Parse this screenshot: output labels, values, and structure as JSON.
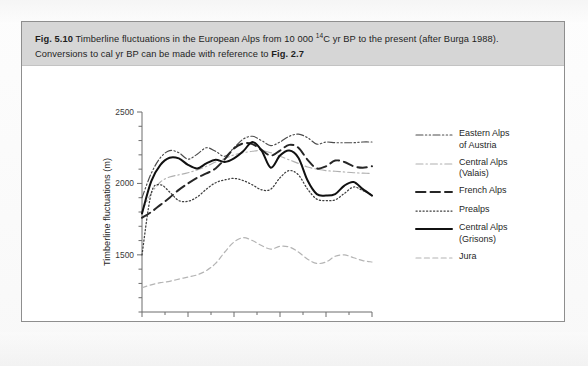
{
  "figure": {
    "caption_number": "Fig. 5.10",
    "caption_line1_a": "  Timberline fluctuations in the European Alps from 10 000 ",
    "caption_sup": "14",
    "caption_line1_b": "C yr BP to the present (after Burga 1988).",
    "caption_line2_a": "Conversions to cal yr BP can be made with reference to ",
    "caption_line2_ref": "Fig. 2.7"
  },
  "chart_data": {
    "type": "line",
    "title": "Timberline fluctuations in the European Alps",
    "xlabel": "Age (10³ years)",
    "ylabel": "Timberline fluctuations (m)",
    "xlim": [
      10,
      0
    ],
    "ylim": [
      1100,
      2500
    ],
    "x_ticks": [
      10,
      8,
      6,
      4,
      2,
      0
    ],
    "x_tick_labels": [
      "10",
      "8",
      "6",
      "4",
      "2",
      "0"
    ],
    "y_ticks": [
      1100,
      1200,
      1300,
      1400,
      1500,
      1600,
      1700,
      1800,
      1900,
      2000,
      2100,
      2200,
      2300,
      2400,
      2500
    ],
    "y_tick_labels_shown": [
      "2500",
      "2000",
      "1500"
    ],
    "y_labeled_ticks": [
      2500,
      2000,
      1500
    ],
    "grid": false,
    "legend_position": "right",
    "x_axis_direction": "reversed",
    "series": [
      {
        "name": "Eastern Alps of Austria",
        "style": "dash-dot-dot",
        "color": "#4c4c4c",
        "x": [
          10.0,
          9.6,
          9.2,
          8.8,
          8.4,
          8.0,
          7.6,
          7.2,
          6.8,
          6.4,
          6.0,
          5.6,
          5.2,
          4.8,
          4.4,
          4.0,
          3.6,
          3.2,
          2.8,
          2.4,
          2.0,
          1.6,
          1.2,
          0.8,
          0.4,
          0.0
        ],
        "y": [
          1900,
          2070,
          2180,
          2230,
          2215,
          2170,
          2205,
          2250,
          2225,
          2190,
          2250,
          2310,
          2330,
          2300,
          2265,
          2290,
          2330,
          2345,
          2320,
          2275,
          2290,
          2285,
          2285,
          2285,
          2290,
          2290
        ]
      },
      {
        "name": "Central Alps (Valais)",
        "style": "dash-dot",
        "color": "#b0b0b0",
        "x": [
          10.0,
          9.6,
          9.2,
          8.8,
          8.4,
          8.0,
          7.6,
          7.2,
          6.8,
          6.4,
          6.0,
          5.6,
          5.2,
          4.8,
          4.4,
          4.0,
          3.6,
          3.2,
          2.8,
          2.4,
          2.0,
          1.6,
          1.2,
          0.8,
          0.4,
          0.0
        ],
        "y": [
          1810,
          1930,
          2010,
          2045,
          2060,
          2075,
          2095,
          2120,
          2150,
          2175,
          2200,
          2215,
          2225,
          2230,
          2215,
          2190,
          2165,
          2140,
          2115,
          2100,
          2090,
          2085,
          2080,
          2075,
          2072,
          2070
        ]
      },
      {
        "name": "French Alps",
        "style": "long-dash",
        "color": "#262626",
        "x": [
          10.0,
          9.6,
          9.2,
          8.8,
          8.4,
          8.0,
          7.6,
          7.2,
          6.8,
          6.4,
          6.0,
          5.6,
          5.2,
          4.8,
          4.4,
          4.0,
          3.6,
          3.2,
          2.8,
          2.4,
          2.0,
          1.6,
          1.2,
          0.8,
          0.4,
          0.0
        ],
        "y": [
          1760,
          1800,
          1850,
          1900,
          1955,
          2000,
          2040,
          2070,
          2105,
          2170,
          2245,
          2280,
          2275,
          2235,
          2195,
          2230,
          2270,
          2250,
          2165,
          2105,
          2120,
          2160,
          2150,
          2120,
          2110,
          2120
        ]
      },
      {
        "name": "Prealps",
        "style": "dotted",
        "color": "#3f3f3f",
        "x": [
          10.0,
          9.6,
          9.2,
          8.8,
          8.4,
          8.0,
          7.6,
          7.2,
          6.8,
          6.4,
          6.0,
          5.6,
          5.2,
          4.8,
          4.4,
          4.0,
          3.6,
          3.2,
          2.8,
          2.4,
          2.0,
          1.6,
          1.2,
          0.8,
          0.4,
          0.0
        ],
        "y": [
          1500,
          1930,
          1990,
          1940,
          1880,
          1875,
          1905,
          1960,
          2005,
          2025,
          2035,
          2020,
          1990,
          1955,
          1960,
          2040,
          2090,
          2060,
          1960,
          1890,
          1880,
          1885,
          1930,
          1975,
          1950,
          1920
        ]
      },
      {
        "name": "Central Alps (Grisons)",
        "style": "solid",
        "color": "#111111",
        "x": [
          10.0,
          9.6,
          9.2,
          8.8,
          8.4,
          8.0,
          7.6,
          7.2,
          6.8,
          6.4,
          6.0,
          5.6,
          5.2,
          4.8,
          4.4,
          4.0,
          3.6,
          3.2,
          2.8,
          2.4,
          2.0,
          1.6,
          1.2,
          0.8,
          0.4,
          0.0
        ],
        "y": [
          1790,
          2015,
          2130,
          2180,
          2175,
          2130,
          2105,
          2140,
          2165,
          2150,
          2175,
          2225,
          2290,
          2230,
          2110,
          2195,
          2230,
          2180,
          2020,
          1925,
          1915,
          1925,
          1985,
          2010,
          1960,
          1915
        ]
      },
      {
        "name": "Jura",
        "style": "dashed",
        "color": "#b4b4b4",
        "x": [
          10.0,
          9.6,
          9.2,
          8.8,
          8.4,
          8.0,
          7.6,
          7.2,
          6.8,
          6.4,
          6.0,
          5.6,
          5.2,
          4.8,
          4.4,
          4.0,
          3.6,
          3.2,
          2.8,
          2.4,
          2.0,
          1.6,
          1.2,
          0.8,
          0.4,
          0.0
        ],
        "y": [
          1270,
          1290,
          1305,
          1315,
          1330,
          1345,
          1360,
          1390,
          1440,
          1520,
          1590,
          1620,
          1600,
          1565,
          1540,
          1560,
          1555,
          1520,
          1470,
          1440,
          1450,
          1490,
          1500,
          1480,
          1460,
          1450
        ]
      }
    ]
  },
  "legend": {
    "items": [
      {
        "label_line1": "Eastern Alps",
        "label_line2": "of Austria",
        "style": "dash-dot-dot"
      },
      {
        "label_line1": "Central Alps",
        "label_line2": "(Valais)",
        "style": "dash-dot"
      },
      {
        "label_line1": "French Alps",
        "label_line2": "",
        "style": "long-dash"
      },
      {
        "label_line1": "Prealps",
        "label_line2": "",
        "style": "dotted"
      },
      {
        "label_line1": "Central Alps",
        "label_line2": "(Grisons)",
        "style": "solid"
      },
      {
        "label_line1": "Jura",
        "label_line2": "",
        "style": "dashed"
      }
    ]
  }
}
